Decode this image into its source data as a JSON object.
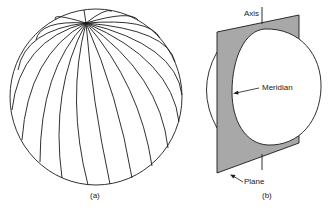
{
  "figure": {
    "panel_a": {
      "caption": "(a)",
      "description": "Sphere with meridians converging at a pole"
    },
    "panel_b": {
      "caption": "(b)",
      "labels": {
        "axis": "Axis",
        "meridian": "Meridian",
        "plane": "Plane"
      }
    },
    "colors": {
      "line": "#1a1a1a",
      "plane_fill": "#a8a8a8",
      "background": "#ffffff"
    }
  }
}
